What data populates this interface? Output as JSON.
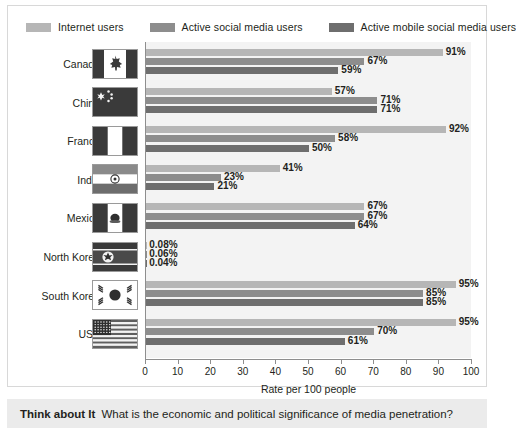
{
  "legend": {
    "items": [
      {
        "label": "Internet users",
        "color": "#b6b6b6",
        "key": "internet"
      },
      {
        "label": "Active social media users",
        "color": "#8d8d8d",
        "key": "social"
      },
      {
        "label": "Active mobile social media users",
        "color": "#6e6e6e",
        "key": "mobile"
      }
    ]
  },
  "axis": {
    "title": "Rate per 100 people",
    "ticks": [
      "0",
      "10",
      "20",
      "30",
      "40",
      "50",
      "60",
      "70",
      "80",
      "90",
      "100"
    ]
  },
  "footer": {
    "heading": "Think about It",
    "question": "What is the economic and political significance of media penetration?"
  },
  "chart_data": {
    "type": "bar",
    "orientation": "horizontal",
    "title": "",
    "xlabel": "Rate per 100 people",
    "ylabel": "",
    "xlim": [
      0,
      100
    ],
    "grid": false,
    "legend_position": "top",
    "categories": [
      "Canada",
      "China",
      "France",
      "India",
      "Mexico",
      "North Korea",
      "South Korea",
      "USA"
    ],
    "series": [
      {
        "name": "Internet users",
        "color": "#b6b6b6",
        "values": [
          91,
          57,
          92,
          41,
          67,
          0.08,
          95,
          95
        ],
        "labels": [
          "91%",
          "57%",
          "92%",
          "41%",
          "67%",
          "0.08%",
          "95%",
          "95%"
        ]
      },
      {
        "name": "Active social media users",
        "color": "#8d8d8d",
        "values": [
          67,
          71,
          58,
          23,
          67,
          0.06,
          85,
          70
        ],
        "labels": [
          "67%",
          "71%",
          "58%",
          "23%",
          "67%",
          "0.06%",
          "85%",
          "70%"
        ]
      },
      {
        "name": "Active mobile social media users",
        "color": "#6e6e6e",
        "values": [
          59,
          71,
          50,
          21,
          64,
          0.04,
          85,
          61
        ],
        "labels": [
          "59%",
          "71%",
          "50%",
          "21%",
          "64%",
          "0.04%",
          "85%",
          "61%"
        ]
      }
    ],
    "flags": [
      {
        "country": "Canada",
        "icon": "flag-canada"
      },
      {
        "country": "China",
        "icon": "flag-china"
      },
      {
        "country": "France",
        "icon": "flag-france"
      },
      {
        "country": "India",
        "icon": "flag-india"
      },
      {
        "country": "Mexico",
        "icon": "flag-mexico"
      },
      {
        "country": "North Korea",
        "icon": "flag-north-korea"
      },
      {
        "country": "South Korea",
        "icon": "flag-south-korea"
      },
      {
        "country": "USA",
        "icon": "flag-usa"
      }
    ]
  }
}
